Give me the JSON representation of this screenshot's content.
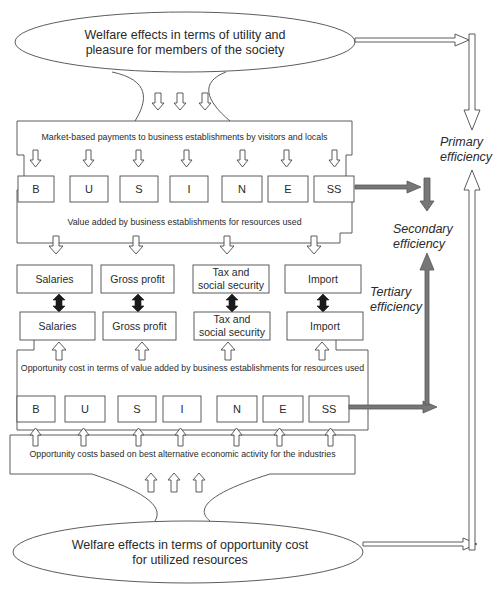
{
  "diagram": {
    "top_ellipse": {
      "line1": "Welfare effects in terms of utility and",
      "line2": "pleasure for members of the society"
    },
    "bottom_ellipse": {
      "line1": "Welfare effects in terms of opportunity cost",
      "line2": "for utilized resources"
    },
    "bands": {
      "market_payments": "Market-based payments to business establishments by visitors and locals",
      "value_added": "Value added by business establishments for resources used",
      "opportunity_value_added": "Opportunity cost in terms of value added by business establishments for resources used",
      "opportunity_alternative": "Opportunity costs based on best alternative economic activity for the industries"
    },
    "business_letters_top": [
      "B",
      "U",
      "S",
      "I",
      "N",
      "E",
      "SS"
    ],
    "business_letters_bottom": [
      "B",
      "U",
      "S",
      "I",
      "N",
      "E",
      "SS"
    ],
    "categories_upper": [
      "Salaries",
      "Gross profit",
      "Tax and",
      "social security",
      "Import"
    ],
    "categories_lower": [
      "Salaries",
      "Gross profit",
      "Tax and",
      "social security",
      "Import"
    ],
    "efficiency_labels": {
      "primary_1": "Primary",
      "primary_2": "efficiency",
      "secondary_1": "Secondary",
      "secondary_2": "efficiency",
      "tertiary_1": "Tertiary",
      "tertiary_2": "efficiency"
    },
    "colors": {
      "line": "#4a4a4a",
      "grey_arrow": "#777777",
      "black_arrow": "#1a1a1a"
    }
  }
}
